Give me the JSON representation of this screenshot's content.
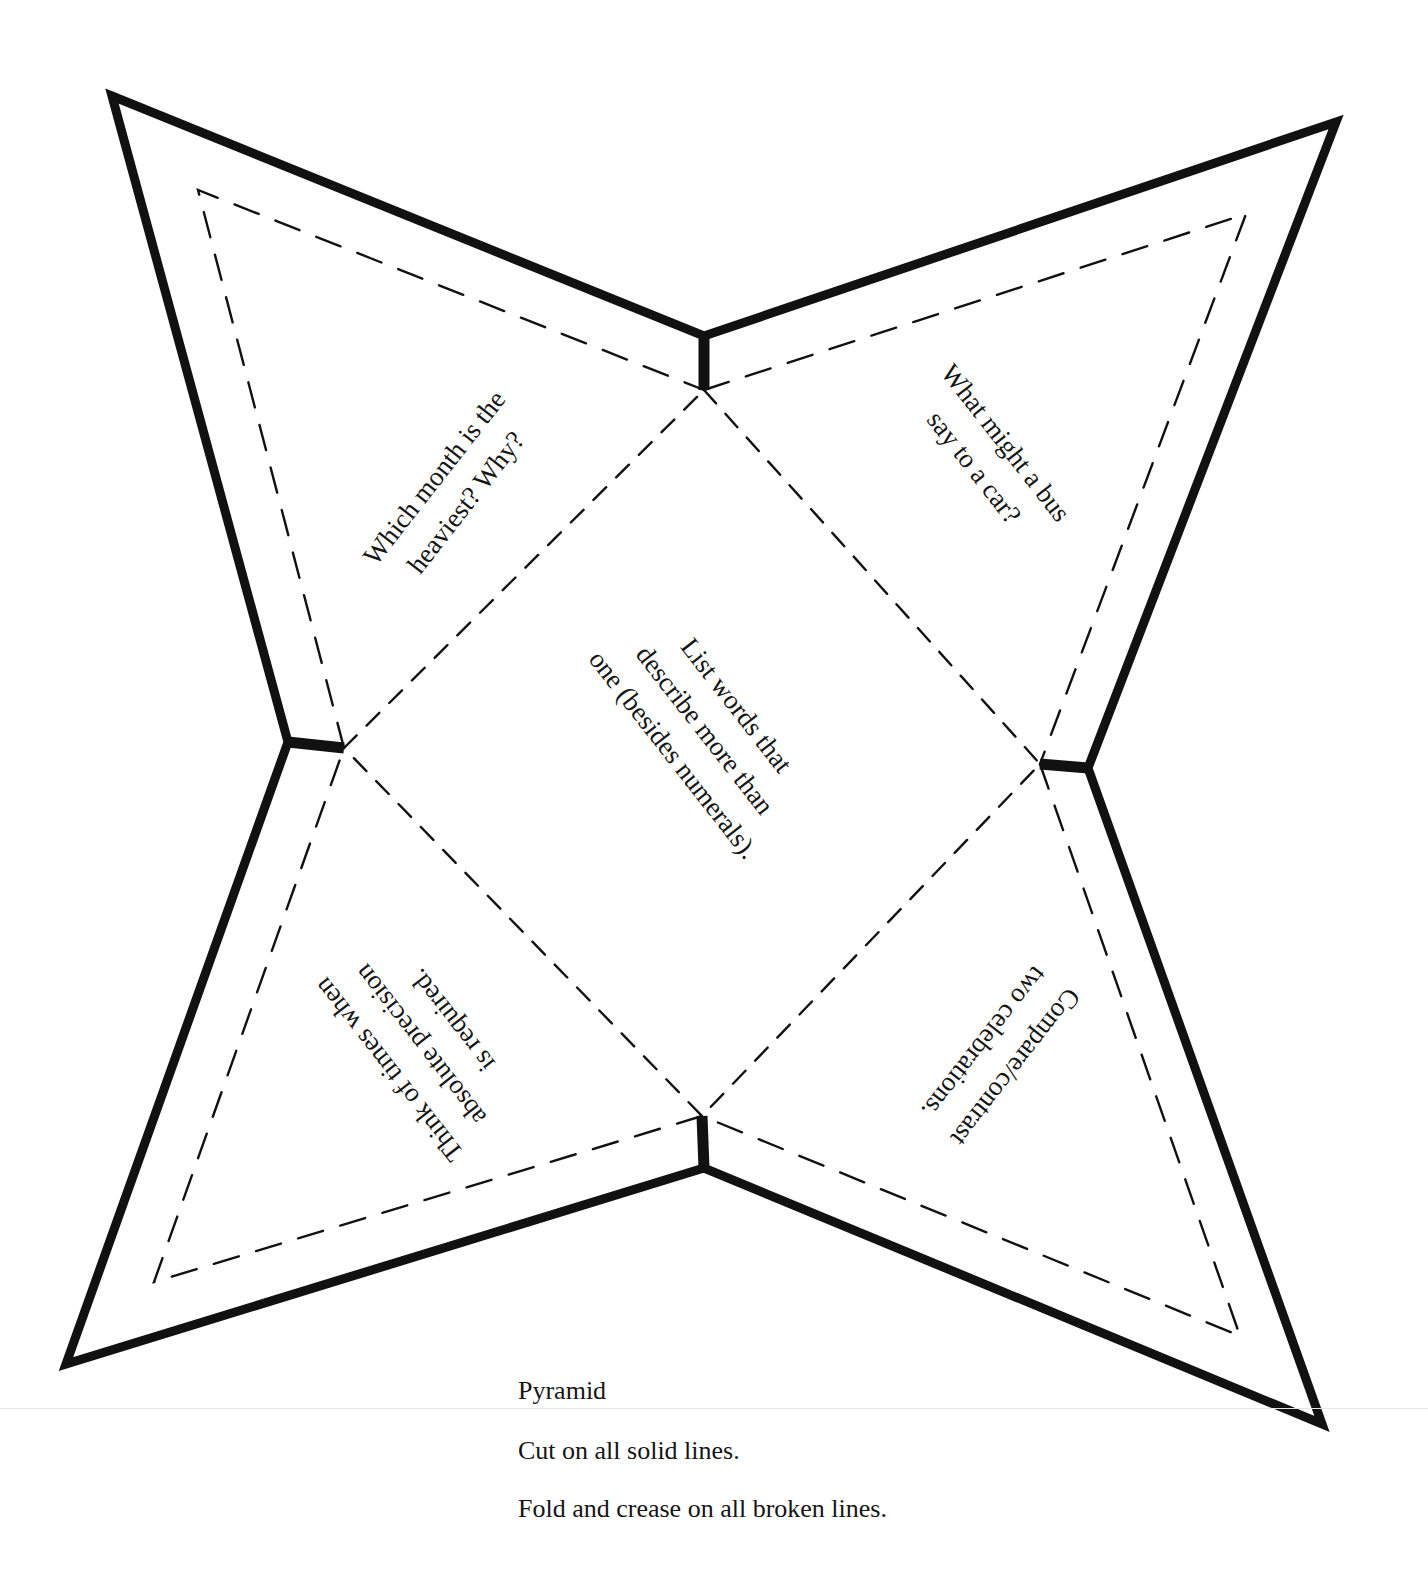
{
  "diagram": {
    "type": "pyramid-net",
    "colors": {
      "line": "#111111",
      "background": "#ffffff",
      "text": "#151515"
    },
    "outer_corners": {
      "top_left": [
        112,
        96
      ],
      "top_right": [
        1336,
        122
      ],
      "bottom_left": [
        66,
        1364
      ],
      "bottom_right": [
        1322,
        1424
      ]
    },
    "inner_corners": {
      "top": [
        704,
        336
      ],
      "left": [
        288,
        742
      ],
      "right": [
        1088,
        768
      ],
      "bottom": [
        704,
        1168
      ]
    },
    "panels": {
      "top_left": {
        "lines": [
          "Which month is the",
          "heaviest? Why?"
        ]
      },
      "top_right": {
        "lines": [
          "What might a bus",
          "say to a car?"
        ]
      },
      "center": {
        "lines": [
          "List words that",
          "describe more than",
          "one (besides numerals)."
        ]
      },
      "bottom_left": {
        "lines": [
          "Think of times when",
          "absolute precision",
          "is required."
        ]
      },
      "bottom_right": {
        "lines": [
          "Compare/contrast",
          "two celebrations."
        ]
      }
    }
  },
  "caption": {
    "title": "Pyramid",
    "instruction_cut": "Cut on all solid lines.",
    "instruction_fold": "Fold and crease on all broken lines."
  }
}
